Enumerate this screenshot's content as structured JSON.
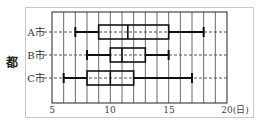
{
  "chart_data": {
    "type": "boxplot",
    "title": "",
    "xlabel": "(日)",
    "ylabel": "都",
    "xlim": [
      5,
      20
    ],
    "x_ticks": [
      "5",
      "10",
      "15",
      "20(日)"
    ],
    "grid": "vertical every 1 day",
    "categories": [
      "A市",
      "B市",
      "C市"
    ],
    "series": [
      {
        "name": "A市",
        "min": 7,
        "q1": 9,
        "median": 11.5,
        "q3": 15,
        "max": 18
      },
      {
        "name": "B市",
        "min": 8,
        "q1": 10,
        "median": 11,
        "q3": 13,
        "max": 15
      },
      {
        "name": "C市",
        "min": 6,
        "q1": 8,
        "median": 10,
        "q3": 12,
        "max": 17
      }
    ]
  },
  "labels": {
    "ylabel": "都",
    "cat_a": "A市",
    "cat_b": "B市",
    "cat_c": "C市",
    "tick_5": "5",
    "tick_10": "10",
    "tick_15": "15",
    "tick_20": "20(日)"
  }
}
